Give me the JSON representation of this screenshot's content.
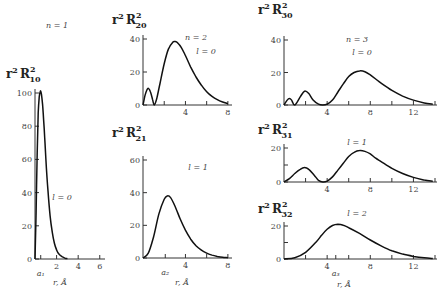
{
  "chart_data": [
    {
      "id": "r10",
      "type": "line",
      "title": "n = 1",
      "ylabel": {
        "base": "r",
        "sup1": "2",
        "func": "R",
        "sub": "10",
        "sup2": "2"
      },
      "annotation": "l = 0",
      "xlabel": "r, Å",
      "xlim": [
        0,
        6.3
      ],
      "ylim": [
        0,
        100
      ],
      "yticks": [
        0,
        20,
        40,
        60,
        80,
        100
      ],
      "xticks": [
        {
          "v": 0.53,
          "label": "a₁"
        },
        {
          "v": 2,
          "label": "2"
        },
        {
          "v": 4,
          "label": "4"
        },
        {
          "v": 6,
          "label": "6"
        }
      ],
      "x": [
        0,
        0.1,
        0.2,
        0.3,
        0.4,
        0.5,
        0.53,
        0.6,
        0.7,
        0.8,
        0.9,
        1.0,
        1.2,
        1.4,
        1.6,
        1.8,
        2.0,
        2.2,
        2.5,
        2.8,
        3.0
      ],
      "y": [
        0,
        28,
        64,
        88,
        98,
        101,
        101,
        99,
        93,
        84,
        73,
        61,
        41,
        26,
        16,
        9.5,
        5.5,
        3.2,
        1.4,
        0.5,
        0.2
      ]
    },
    {
      "id": "r20",
      "type": "line",
      "title": "n = 2",
      "ylabel": {
        "base": "r",
        "sup1": "2",
        "func": "R",
        "sub": "20",
        "sup2": "2"
      },
      "annotation": "l = 0",
      "xlabel": "",
      "xlim": [
        0,
        8.2
      ],
      "ylim": [
        0,
        40
      ],
      "yticks": [
        0,
        20,
        40
      ],
      "xticks": [
        {
          "v": 2,
          "label": ""
        },
        {
          "v": 4,
          "label": "4"
        },
        {
          "v": 6,
          "label": ""
        },
        {
          "v": 8,
          "label": "8"
        }
      ],
      "x": [
        0,
        0.2,
        0.4,
        0.53,
        0.7,
        0.9,
        1.06,
        1.3,
        1.6,
        2.0,
        2.4,
        2.8,
        3.0,
        3.2,
        3.6,
        4.0,
        4.5,
        5.0,
        5.5,
        6.0,
        6.5,
        7.0,
        7.5,
        8.0
      ],
      "y": [
        0,
        6,
        9.5,
        10,
        8,
        3.5,
        0,
        4,
        13,
        25,
        34,
        38,
        38.5,
        38,
        35,
        30,
        23,
        17,
        12,
        8,
        5.2,
        3.2,
        1.8,
        0.8
      ]
    },
    {
      "id": "r21",
      "type": "line",
      "title": "",
      "ylabel": {
        "base": "r",
        "sup1": "2",
        "func": "R",
        "sub": "21",
        "sup2": "2"
      },
      "annotation": "l = 1",
      "xlabel": "r, Å",
      "xlim": [
        0,
        8.2
      ],
      "ylim": [
        0,
        60
      ],
      "yticks": [
        0,
        20,
        40,
        60
      ],
      "xticks": [
        {
          "v": 2.1,
          "label": "a₂"
        },
        {
          "v": 4,
          "label": "4"
        },
        {
          "v": 6,
          "label": ""
        },
        {
          "v": 8,
          "label": "8"
        }
      ],
      "x": [
        0,
        0.5,
        1.0,
        1.5,
        2.0,
        2.3,
        2.6,
        3.0,
        3.5,
        4.0,
        4.5,
        5.0,
        5.5,
        6.0,
        6.5,
        7.0,
        7.5,
        8.0
      ],
      "y": [
        0,
        3,
        13,
        27,
        36,
        38,
        37,
        32,
        24,
        17,
        11.5,
        7.5,
        4.8,
        3,
        1.8,
        1,
        0.5,
        0.2
      ]
    },
    {
      "id": "r30",
      "type": "line",
      "title": "n = 3",
      "ylabel": {
        "base": "r",
        "sup1": "2",
        "func": "R",
        "sub": "30",
        "sup2": "2"
      },
      "annotation": "l = 0",
      "xlabel": "",
      "xlim": [
        0,
        14
      ],
      "ylim": [
        0,
        40
      ],
      "yticks": [
        0,
        20,
        40
      ],
      "xticks": [
        {
          "v": 2,
          "label": ""
        },
        {
          "v": 4,
          "label": "4"
        },
        {
          "v": 6,
          "label": ""
        },
        {
          "v": 8,
          "label": "8"
        },
        {
          "v": 10,
          "label": ""
        },
        {
          "v": 12,
          "label": "12"
        },
        {
          "v": 14,
          "label": ""
        }
      ],
      "x": [
        0,
        0.3,
        0.5,
        0.7,
        1.0,
        1.5,
        1.9,
        2.3,
        2.7,
        3.2,
        3.6,
        4.0,
        4.5,
        5.0,
        5.5,
        6.0,
        6.5,
        7.0,
        7.5,
        8.0,
        8.5,
        9.0,
        10.0,
        11.0,
        12.0,
        13.0,
        13.8
      ],
      "y": [
        0,
        3,
        4,
        3,
        0,
        5,
        8.5,
        7,
        3,
        0.5,
        0,
        0.5,
        3,
        8,
        13,
        17.5,
        20,
        21,
        20.5,
        18.5,
        16,
        13.5,
        9,
        5.5,
        3,
        1.3,
        0.5
      ]
    },
    {
      "id": "r31",
      "type": "line",
      "title": "",
      "ylabel": {
        "base": "r",
        "sup1": "2",
        "func": "R",
        "sub": "31",
        "sup2": "2"
      },
      "annotation": "l = 1",
      "xlabel": "",
      "xlim": [
        0,
        14
      ],
      "ylim": [
        0,
        20
      ],
      "yticks": [
        0,
        10,
        20
      ],
      "xticks": [
        {
          "v": 2,
          "label": ""
        },
        {
          "v": 4,
          "label": "4"
        },
        {
          "v": 6,
          "label": ""
        },
        {
          "v": 8,
          "label": "8"
        },
        {
          "v": 10,
          "label": ""
        },
        {
          "v": 12,
          "label": "12"
        },
        {
          "v": 14,
          "label": ""
        }
      ],
      "x": [
        0,
        0.5,
        1.0,
        1.5,
        1.9,
        2.3,
        2.8,
        3.2,
        3.6,
        4.0,
        4.5,
        5.0,
        5.5,
        6.0,
        6.5,
        7.0,
        7.5,
        8.0,
        8.5,
        9.0,
        10.0,
        11.0,
        12.0,
        13.0,
        13.8
      ],
      "y": [
        0,
        2,
        5,
        7.5,
        8.5,
        7.5,
        4,
        1,
        0,
        0.5,
        3,
        7,
        11,
        15,
        17.5,
        18.5,
        18,
        16.5,
        14,
        12,
        8,
        5,
        2.7,
        1.2,
        0.5
      ]
    },
    {
      "id": "r32",
      "type": "line",
      "title": "",
      "ylabel": {
        "base": "r",
        "sup1": "2",
        "func": "R",
        "sub": "32",
        "sup2": "2"
      },
      "annotation": "l = 2",
      "xlabel": "r, Å",
      "xlim": [
        0,
        14
      ],
      "ylim": [
        0,
        20
      ],
      "yticks": [
        0,
        10,
        20
      ],
      "xticks": [
        {
          "v": 2,
          "label": ""
        },
        {
          "v": 4,
          "label": "4"
        },
        {
          "v": 4.8,
          "label": "a₃"
        },
        {
          "v": 6,
          "label": ""
        },
        {
          "v": 8,
          "label": "8"
        },
        {
          "v": 10,
          "label": ""
        },
        {
          "v": 12,
          "label": "12"
        },
        {
          "v": 14,
          "label": ""
        }
      ],
      "x": [
        0,
        1.0,
        2.0,
        3.0,
        3.5,
        4.0,
        4.5,
        5.0,
        5.5,
        6.0,
        7.0,
        8.0,
        9.0,
        10.0,
        11.0,
        12.0,
        13.0,
        13.8
      ],
      "y": [
        0,
        0.8,
        4,
        10.5,
        14.5,
        18,
        20.3,
        21,
        20.5,
        19,
        15.5,
        11.5,
        8,
        5,
        3,
        1.6,
        0.7,
        0.3
      ]
    }
  ]
}
